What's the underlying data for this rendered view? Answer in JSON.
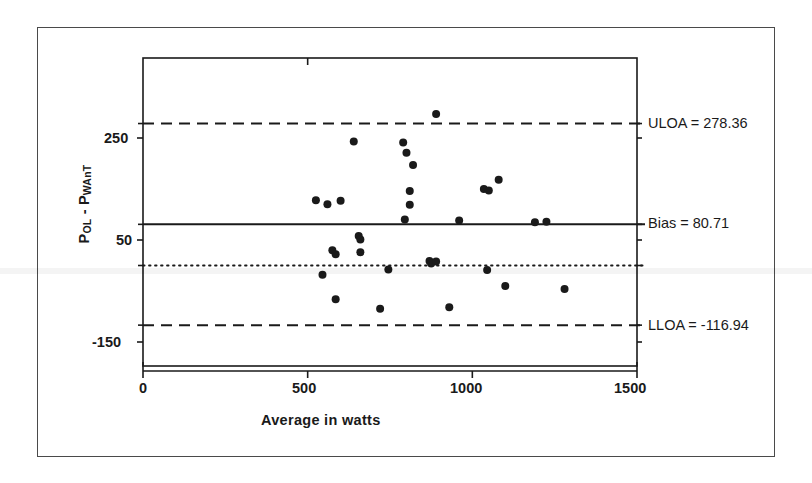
{
  "chart_data": {
    "type": "scatter",
    "title": "",
    "xlabel": "Average in watts",
    "ylabel": "POL - PWAnT",
    "ylabel_parts": {
      "first_symbol": "P",
      "first_sub": "OL",
      "separator": " - ",
      "second_symbol": "P",
      "second_sub": "WAnT"
    },
    "xlim": [
      0,
      1500
    ],
    "ylim": [
      -250,
      370
    ],
    "xticks": [
      0,
      500,
      1000,
      1500
    ],
    "xtick_labels": [
      "0",
      "500",
      "1000",
      "1500"
    ],
    "yticks": [
      250,
      50,
      -150
    ],
    "ytick_labels": [
      "250",
      "50",
      "-150"
    ],
    "grid": false,
    "legend": "none",
    "marker": "filled-circle",
    "marker_color": "#1a1a1a",
    "reference_lines": [
      {
        "name": "ULOA",
        "label": "ULOA = 278.36",
        "value": 278.36,
        "style": "dashed"
      },
      {
        "name": "Bias",
        "label": "Bias = 80.71",
        "value": 80.71,
        "style": "solid"
      },
      {
        "name": "Zero",
        "label": "",
        "value": 0,
        "style": "dotted"
      },
      {
        "name": "LLOA",
        "label": "LLOA = -116.94",
        "value": -116.94,
        "style": "dashed"
      }
    ],
    "points": [
      {
        "x": 890,
        "y": 297
      },
      {
        "x": 790,
        "y": 241
      },
      {
        "x": 640,
        "y": 243
      },
      {
        "x": 800,
        "y": 221
      },
      {
        "x": 820,
        "y": 197
      },
      {
        "x": 1080,
        "y": 168
      },
      {
        "x": 1035,
        "y": 150
      },
      {
        "x": 1050,
        "y": 147
      },
      {
        "x": 810,
        "y": 146
      },
      {
        "x": 525,
        "y": 128
      },
      {
        "x": 560,
        "y": 120
      },
      {
        "x": 600,
        "y": 127
      },
      {
        "x": 810,
        "y": 119
      },
      {
        "x": 795,
        "y": 90
      },
      {
        "x": 960,
        "y": 88
      },
      {
        "x": 1190,
        "y": 85
      },
      {
        "x": 1225,
        "y": 86
      },
      {
        "x": 655,
        "y": 58
      },
      {
        "x": 660,
        "y": 51
      },
      {
        "x": 575,
        "y": 30
      },
      {
        "x": 585,
        "y": 22
      },
      {
        "x": 660,
        "y": 26
      },
      {
        "x": 870,
        "y": 9
      },
      {
        "x": 875,
        "y": 4
      },
      {
        "x": 890,
        "y": 8
      },
      {
        "x": 745,
        "y": -8
      },
      {
        "x": 1045,
        "y": -9
      },
      {
        "x": 545,
        "y": -18
      },
      {
        "x": 1100,
        "y": -40
      },
      {
        "x": 1280,
        "y": -46
      },
      {
        "x": 585,
        "y": -66
      },
      {
        "x": 720,
        "y": -85
      },
      {
        "x": 930,
        "y": -82
      }
    ]
  },
  "axes": {
    "x_title": "Average in watts",
    "y_title_p1": "P",
    "y_title_sub1": "OL",
    "y_title_sep": " - ",
    "y_title_p2": "P",
    "y_title_sub2": "WAnT",
    "xtick_0": "0",
    "xtick_1": "500",
    "xtick_2": "1000",
    "xtick_3": "1500",
    "ytick_0": "250",
    "ytick_1": "50",
    "ytick_2": "-150"
  },
  "annotations": {
    "uloa": "ULOA = 278.36",
    "bias": "Bias = 80.71",
    "lloa": "LLOA = -116.94"
  },
  "colors": {
    "ink": "#1a1a1a",
    "frame": "#4a4a4a",
    "marker": "#1a1a1a"
  }
}
